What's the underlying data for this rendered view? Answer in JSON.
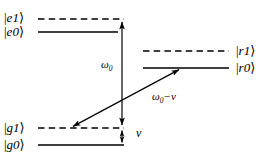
{
  "figure": {
    "type": "energy-level-diagram",
    "width": 271,
    "height": 163,
    "background": "#ffffff",
    "line_color": "#000000"
  },
  "levels": {
    "e1": {
      "label_bar": "|",
      "label_sym": "e1",
      "label_close": "⟩",
      "text": "|e1⟩",
      "style": "dashed",
      "y": 19,
      "x1": 38,
      "x2": 124,
      "side": "left"
    },
    "e0": {
      "label_bar": "|",
      "label_sym": "e0",
      "label_close": "⟩",
      "text": "|e0⟩",
      "style": "solid",
      "y": 32,
      "x1": 38,
      "x2": 118,
      "side": "left"
    },
    "g1": {
      "label_bar": "|",
      "label_sym": "g1",
      "label_close": "⟩",
      "text": "|g1⟩",
      "style": "dashed",
      "y": 128,
      "x1": 38,
      "x2": 124,
      "side": "left"
    },
    "g0": {
      "label_bar": "|",
      "label_sym": "g0",
      "label_close": "⟩",
      "text": "|g0⟩",
      "style": "solid",
      "y": 145,
      "x1": 38,
      "x2": 124,
      "side": "left"
    },
    "r1": {
      "label_bar": "|",
      "label_sym": "r1",
      "label_close": "⟩",
      "text": "|r1⟩",
      "style": "dashed",
      "y": 51,
      "x1": 143,
      "x2": 229,
      "side": "right"
    },
    "r0": {
      "label_bar": "|",
      "label_sym": "r0",
      "label_close": "⟩",
      "text": "|r0⟩",
      "style": "solid",
      "y": 68,
      "x1": 143,
      "x2": 229,
      "side": "right"
    }
  },
  "transitions": {
    "carrier": {
      "name": "omega0-vertical-transition",
      "label_main": "ω",
      "label_sub": "0",
      "text": "ω0",
      "x": 122,
      "y_top": 19,
      "y_bottom": 128,
      "arrowheads": "both"
    },
    "sideband": {
      "name": "red-sideband-transition",
      "label_main": "ω",
      "label_sub": "0",
      "label_tail": "−ν",
      "text": "ω0−ν",
      "x1": 70,
      "y1": 128,
      "x2": 182,
      "y2": 68,
      "arrowheads": "both"
    },
    "motional": {
      "name": "nu-mode-spacing",
      "label_main": "ν",
      "text": "ν",
      "x": 122,
      "y_top": 128,
      "y_bottom": 145,
      "arrowheads": "both"
    }
  }
}
